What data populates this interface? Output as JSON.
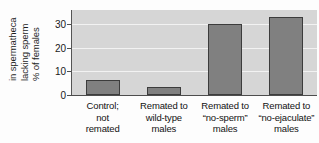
{
  "chart_data": {
    "type": "bar",
    "title": "",
    "xlabel": "",
    "ylabel": "% of females lacking sperm in spermatheca",
    "ylabel_lines": [
      "% of females",
      "lacking sperm",
      "in spermatheca"
    ],
    "categories": [
      "Control; not remated",
      "Remated to wild-type males",
      "Remated to “no-sperm” males",
      "Remated to “no-ejaculate” males"
    ],
    "category_lines": [
      [
        "Control;",
        "not",
        "remated"
      ],
      [
        "Remated to",
        "wild-type",
        "males"
      ],
      [
        "Remated to",
        "“no-sperm”",
        "males"
      ],
      [
        "Remated to",
        "“no-ejaculate”",
        "males"
      ]
    ],
    "values": [
      6.5,
      3.5,
      30,
      33
    ],
    "ylim": [
      0,
      36
    ],
    "yticks": [
      0,
      10,
      20,
      30
    ],
    "ytick_labels": [
      "0",
      "10",
      "20",
      "30"
    ],
    "grid": true,
    "grid_axis": "y",
    "legend": false,
    "bar_color": "#808080",
    "bar_edge_color": "#3c3c3c",
    "plot_background": "#d6d6d6",
    "gridline_color": "#f2f2f2",
    "axis_color": "#4d4d4d",
    "figure_background": "#fdfdfd"
  }
}
